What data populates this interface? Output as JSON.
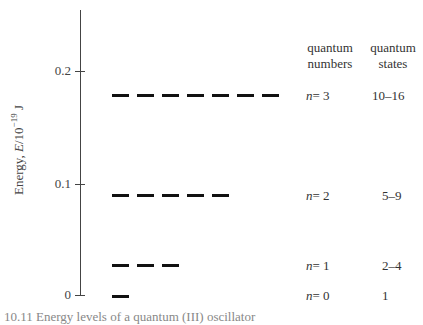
{
  "diagram": {
    "type": "energy-level-diagram",
    "y_axis": {
      "label_prefix": "Energy, ",
      "label_var": "E",
      "label_unit_base": "/10",
      "label_exponent": "−19",
      "label_unit": " J",
      "ticks": [
        "0",
        "0.1",
        "0.2"
      ]
    },
    "columns": {
      "quantum_numbers_header_line1": "quantum",
      "quantum_numbers_header_line2": "numbers",
      "quantum_states_header_line1": "quantum",
      "quantum_states_header_line2": "states"
    },
    "levels": [
      {
        "n_var": "n",
        "n_value": "= 3",
        "states": "10–16",
        "energy": 0.179,
        "degeneracy": 7
      },
      {
        "n_var": "n",
        "n_value": "= 2",
        "states": "5–9",
        "energy": 0.089,
        "degeneracy": 5
      },
      {
        "n_var": "n",
        "n_value": "= 1",
        "states": "2–4",
        "energy": 0.027,
        "degeneracy": 3
      },
      {
        "n_var": "n",
        "n_value": "= 0",
        "states": "1",
        "energy": 0.0,
        "degeneracy": 1
      }
    ],
    "caption": "10.11  Energy levels of a quantum (III) oscillator"
  }
}
